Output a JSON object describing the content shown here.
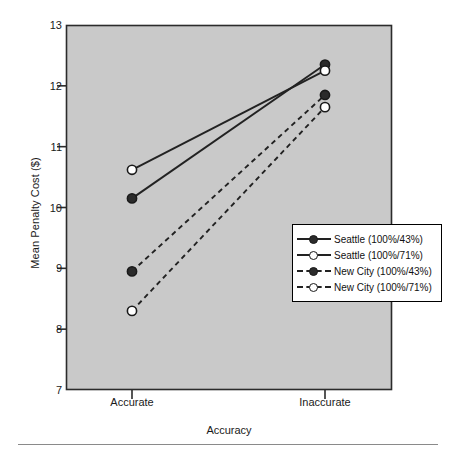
{
  "chart_data": {
    "type": "line",
    "title": "",
    "xlabel": "Accuracy",
    "ylabel": "Mean Penalty Cost ($)",
    "categories": [
      "Accurate",
      "Inaccurate"
    ],
    "ylim": [
      7,
      13
    ],
    "yticks": [
      7,
      8,
      9,
      10,
      11,
      12,
      13
    ],
    "ytick_labels": [
      "7",
      "8",
      "9",
      "10",
      "11",
      "12",
      "13"
    ],
    "grid": false,
    "legend_position": "inside-right",
    "plot_background": "#c9c9c9",
    "line_color": "#222222",
    "series": [
      {
        "name": "Seattle (100%/43%)",
        "values": [
          10.15,
          12.35
        ],
        "marker": "filled-circle",
        "linestyle": "solid"
      },
      {
        "name": "Seattle (100%/71%)",
        "values": [
          10.62,
          12.25
        ],
        "marker": "open-circle",
        "linestyle": "solid"
      },
      {
        "name": "New City (100%/43%)",
        "values": [
          8.95,
          11.85
        ],
        "marker": "filled-circle",
        "linestyle": "dashed"
      },
      {
        "name": "New City (100%/71%)",
        "values": [
          8.3,
          11.65
        ],
        "marker": "open-circle",
        "linestyle": "dashed"
      }
    ]
  },
  "axis": {
    "ylabel": "Mean Penalty Cost ($)",
    "xlabel": "Accuracy"
  },
  "legend": {
    "entries": [
      {
        "label": "Seattle (100%/43%)",
        "marker": "filled-circle",
        "linestyle": "solid"
      },
      {
        "label": "Seattle (100%/71%)",
        "marker": "open-circle",
        "linestyle": "solid"
      },
      {
        "label": "New City (100%/43%)",
        "marker": "filled-circle",
        "linestyle": "dashed"
      },
      {
        "label": "New City (100%/71%)",
        "marker": "open-circle",
        "linestyle": "dashed"
      }
    ]
  }
}
